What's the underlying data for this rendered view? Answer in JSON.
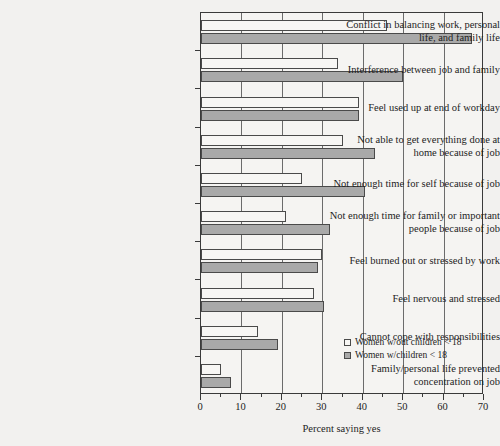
{
  "chart_data": {
    "type": "bar",
    "orientation": "horizontal",
    "title": "",
    "xlabel": "Percent saying yes",
    "ylabel": "",
    "xlim": [
      0,
      70
    ],
    "xticks": [
      0,
      10,
      20,
      30,
      40,
      50,
      60,
      70
    ],
    "xtick_labels": [
      "0",
      "10",
      "20",
      "30",
      "40",
      "50",
      "60",
      "70"
    ],
    "minor_tick_step": 5,
    "grid": "vertical",
    "legend_position": "inside-lower-right",
    "categories": [
      "Conflict in balancing work, personal life, and family life",
      "Interference between job and family",
      "Feel used up at end of workday",
      "Not able to get everything done at home because of job",
      "Not enough time for self because of job",
      "Not enough time for family or important people because of job",
      "Feel burned out or stressed by work",
      "Feel nervous and stressed",
      "Cannot cope with responsibilities",
      "Family/personal life prevented concentration on job"
    ],
    "category_lines": [
      [
        "Conflict in balancing work, personal",
        "life, and family life"
      ],
      [
        "Interference between job and family"
      ],
      [
        "Feel used up at end of workday"
      ],
      [
        "Not able to get everything done at",
        "home because of job"
      ],
      [
        "Not enough time for self because of job"
      ],
      [
        "Not enough time for family or important",
        "people because of job"
      ],
      [
        "Feel burned out or stressed by work"
      ],
      [
        "Feel nervous and stressed"
      ],
      [
        "Cannot cope with responsibilities"
      ],
      [
        "Family/personal life prevented",
        "concentration on job"
      ]
    ],
    "series": [
      {
        "name": "Women w/out children < 18",
        "color": "#f7f6f4",
        "values": [
          46,
          34,
          39,
          35,
          25,
          21,
          30,
          28,
          14,
          5
        ]
      },
      {
        "name": "Women w/children < 18",
        "color": "#a9a9a9",
        "values": [
          67,
          50,
          39,
          43,
          40.5,
          32,
          29,
          30.5,
          19,
          7.5
        ]
      }
    ]
  },
  "legend": {
    "items": [
      {
        "label": "Women w/out children < 18",
        "swatch": "nochild"
      },
      {
        "label": "Women w/children < 18",
        "swatch": "child"
      }
    ]
  },
  "colors": {
    "background": "#f2f1ef",
    "plot_background": "#f5f4f2",
    "axis": "#3a3a3a",
    "grid": "#6b6b6b",
    "bar_nochild": "#f7f6f4",
    "bar_child": "#a9a9a9",
    "text": "#1d1d1d"
  }
}
